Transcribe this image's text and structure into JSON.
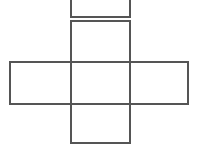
{
  "figure": {
    "background_color": "#ffffff",
    "stroke_color": "#555555",
    "stroke_width": 2,
    "width": 198,
    "height": 147
  },
  "chart_data": {
    "type": "diagram",
    "subtype": "cube-net-cross",
    "units": "pixels",
    "canvas": {
      "width": 198,
      "height": 147
    },
    "grid": {
      "columns_x": [
        10,
        71,
        130,
        188
      ],
      "rows_y": [
        -40,
        17,
        21,
        62,
        104,
        143
      ],
      "cell_width": 59,
      "cell_height": 41
    },
    "faces": [
      {
        "name": "top-partial-face",
        "position": "column-center-row-0",
        "x": 71,
        "y": -40,
        "width": 59,
        "height": 57,
        "clipped": true,
        "clipped_edge": "top",
        "fill": "#ffffff",
        "stroke": "#555555"
      },
      {
        "name": "upper-face",
        "position": "column-center-row-1",
        "x": 71,
        "y": 21,
        "width": 59,
        "height": 41,
        "clipped": false,
        "fill": "#ffffff",
        "stroke": "#555555"
      },
      {
        "name": "left-face",
        "position": "column-left-row-2",
        "x": 10,
        "y": 62,
        "width": 61,
        "height": 42,
        "clipped": false,
        "fill": "#ffffff",
        "stroke": "#555555"
      },
      {
        "name": "center-face",
        "position": "column-center-row-2",
        "x": 71,
        "y": 62,
        "width": 59,
        "height": 42,
        "clipped": false,
        "fill": "#ffffff",
        "stroke": "#555555"
      },
      {
        "name": "right-face",
        "position": "column-right-row-2",
        "x": 130,
        "y": 62,
        "width": 58,
        "height": 42,
        "clipped": false,
        "fill": "#ffffff",
        "stroke": "#555555"
      },
      {
        "name": "bottom-face",
        "position": "column-center-row-3",
        "x": 71,
        "y": 104,
        "width": 59,
        "height": 39,
        "clipped": false,
        "fill": "#ffffff",
        "stroke": "#555555"
      }
    ],
    "face_count": 6,
    "labels": [],
    "annotations": []
  }
}
